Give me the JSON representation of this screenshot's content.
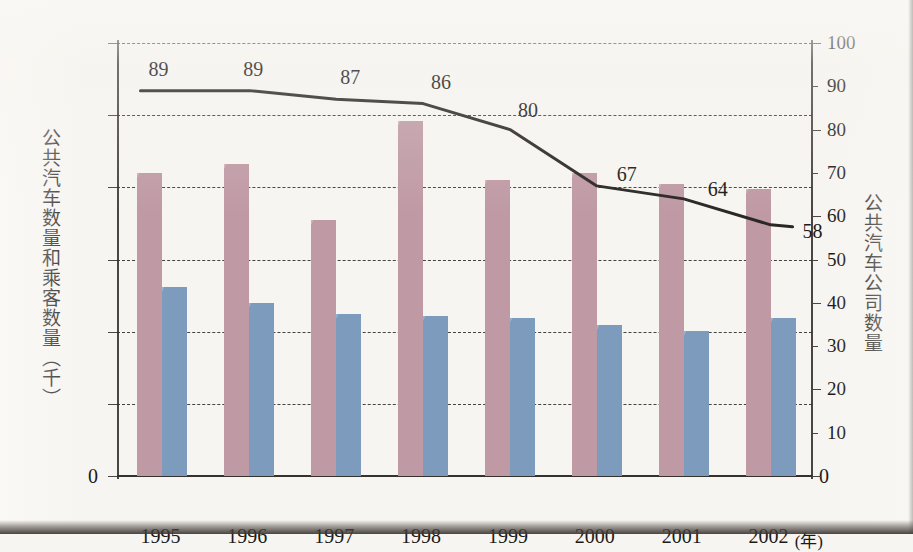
{
  "chart_data": {
    "type": "bar",
    "title": "",
    "subtitle": "",
    "xlabel": "年",
    "x_unit_label": "(年)",
    "categories": [
      "1995",
      "1996",
      "1997",
      "1998",
      "1999",
      "2000",
      "2001",
      "2002"
    ],
    "left_axis": {
      "label": "公共汽车数量和乘客数量（千）",
      "ylim": [
        0,
        12000
      ],
      "ticks": [
        0,
        2000,
        4000,
        6000,
        8000,
        10000,
        12000
      ],
      "tick_labels": [
        "0",
        "2000",
        "4000",
        "6000",
        "8000",
        "10000",
        "12000"
      ]
    },
    "right_axis": {
      "label": "公共汽车公司数量",
      "ylim": [
        0,
        100
      ],
      "ticks": [
        0,
        10,
        20,
        30,
        40,
        50,
        60,
        70,
        80,
        90,
        100
      ],
      "tick_labels": [
        "0",
        "10",
        "20",
        "30",
        "40",
        "50",
        "60",
        "70",
        "80",
        "90",
        "100"
      ]
    },
    "grid": true,
    "grid_style": "dashed-horizontal",
    "legend": "none",
    "series": [
      {
        "name": "公共汽车数量",
        "kind": "bar",
        "axis": "left",
        "color": "#bf9aa5",
        "values": [
          8400,
          8650,
          7100,
          9850,
          8200,
          8400,
          8080,
          7950
        ]
      },
      {
        "name": "乘客数量",
        "kind": "bar",
        "axis": "left",
        "color": "#7d9bbd",
        "values": [
          5250,
          4800,
          4480,
          4430,
          4370,
          4180,
          4010,
          4380
        ]
      },
      {
        "name": "公共汽车公司数量",
        "kind": "line",
        "axis": "right",
        "color": "#2b2724",
        "values": [
          89,
          89,
          87,
          86,
          80,
          67,
          64,
          58
        ],
        "point_labels": [
          "89",
          "89",
          "87",
          "86",
          "80",
          "67",
          "64",
          "58"
        ]
      }
    ]
  }
}
